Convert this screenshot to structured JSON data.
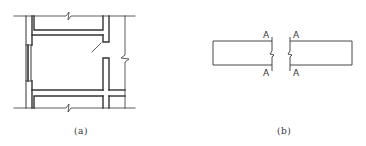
{
  "figures": [
    {
      "id": "a",
      "caption": "(a)",
      "description": "Floor plan fragment with walls, window, door swing and break lines"
    },
    {
      "id": "b",
      "caption": "(b)",
      "description": "Two rectangles separated by section cut lines",
      "section_labels": [
        "A",
        "A",
        "A",
        "A"
      ]
    }
  ],
  "colors": {
    "line": "#333333",
    "background": "#ffffff"
  }
}
